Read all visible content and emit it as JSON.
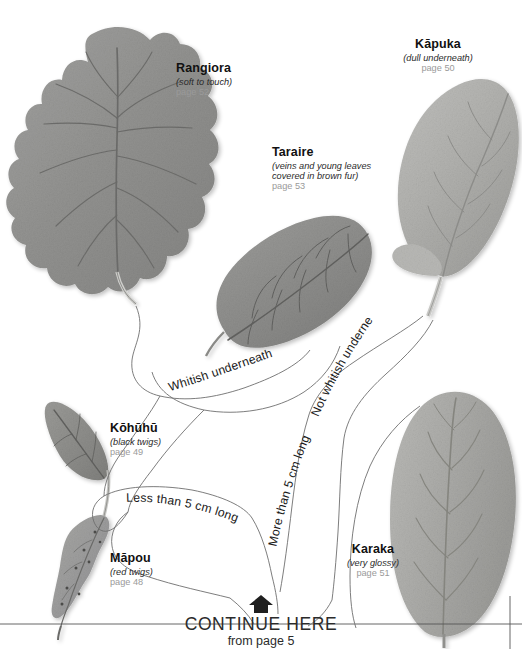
{
  "page": {
    "type": "botanical-identification-key",
    "background": "#ffffff",
    "line_color": "#6e6e6e"
  },
  "species": [
    {
      "id": "rangiora",
      "name": "Rangiora",
      "note": "(soft to touch)",
      "page": "page 52"
    },
    {
      "id": "taraire",
      "name": "Taraire",
      "note": "(veins and young leaves\ncovered in brown fur)",
      "note_line1": "(veins and young leaves",
      "note_line2": "covered in brown fur)",
      "page": "page 53"
    },
    {
      "id": "kapuka",
      "name": "Kāpuka",
      "note": "(dull underneath)",
      "page": "page 50"
    },
    {
      "id": "kohuhu",
      "name": "Kōhūhū",
      "note": "(black twigs)",
      "page": "page 49"
    },
    {
      "id": "mapou",
      "name": "Māpou",
      "note": "(red twigs)",
      "page": "page 48"
    },
    {
      "id": "karaka",
      "name": "Karaka",
      "note": "(very glossy)",
      "page": "page 51"
    }
  ],
  "branches": [
    {
      "id": "whitish-underneath",
      "label": "Whitish underneath"
    },
    {
      "id": "not-whitish-underneath",
      "label": "Not whitish underneath"
    },
    {
      "id": "less-than-5cm",
      "label": "Less than 5 cm long"
    },
    {
      "id": "more-than-5cm",
      "label": "More than 5 cm long"
    }
  ],
  "continue": {
    "icon": "up-arrow-icon",
    "title": "CONTINUE HERE",
    "subtitle": "from page 5"
  }
}
